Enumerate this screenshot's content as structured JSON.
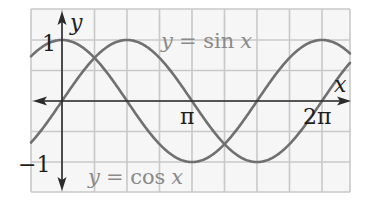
{
  "chart_data": {
    "type": "line",
    "title": "",
    "xlabel": "x",
    "ylabel": "y",
    "x_tick_labels": [
      "π",
      "2π"
    ],
    "x_ticks": [
      3.14159,
      6.28318
    ],
    "y_tick_labels": [
      "1",
      "−1"
    ],
    "y_ticks": [
      1,
      -1
    ],
    "xlim": [
      -0.96,
      8.85
    ],
    "ylim": [
      -1.5,
      1.5
    ],
    "grid": true,
    "legend": "inline annotations",
    "series": [
      {
        "name": "y = sin x",
        "function": "sin",
        "color": "#6f6f6f"
      },
      {
        "name": "y = cos x",
        "function": "cos",
        "color": "#6f6f6f"
      }
    ],
    "annotations": [
      {
        "text": "y = sin x",
        "position": "upper-right of first sin peak"
      },
      {
        "text": "y = cos x",
        "position": "bottom, below first trough"
      }
    ]
  },
  "labels": {
    "y_axis": "y",
    "x_axis": "x",
    "one": "1",
    "neg_one": "−1",
    "pi": "π",
    "two_pi": "2π",
    "sin_eq_y": "y",
    "sin_eq_rest": "= sin",
    "sin_eq_x": "x",
    "cos_eq_y": "y",
    "cos_eq_rest": "= cos",
    "cos_eq_x": "x"
  },
  "colors": {
    "grid": "#c9c9c9",
    "grid_bg": "#f6f6f6",
    "axis": "#2b2b2b",
    "curve": "#707070",
    "text_dark": "#1e1e1e",
    "text_gray": "#8a8a8a"
  }
}
